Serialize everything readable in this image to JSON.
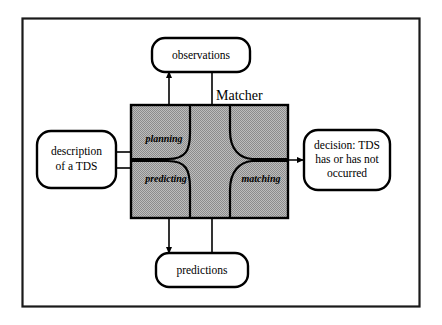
{
  "figure": {
    "type": "block-diagram",
    "border": {
      "color": "#1a1a1a"
    },
    "matcher": {
      "label": "Matcher",
      "fill_color": "#a9a9a9",
      "border_color": "#000000"
    },
    "regions": [
      {
        "id": "planning",
        "label": "planning"
      },
      {
        "id": "predicting",
        "label": "predicting"
      },
      {
        "id": "matching",
        "label": "matching"
      }
    ],
    "nodes": [
      {
        "id": "observations",
        "label": "observations",
        "lines": [
          "observations"
        ]
      },
      {
        "id": "description",
        "label": "description of a TDS",
        "lines": [
          "description",
          "of a TDS"
        ]
      },
      {
        "id": "predictions",
        "label": "predictions",
        "lines": [
          "predictions"
        ]
      },
      {
        "id": "decision",
        "label": "decision: TDS has or has not occurred",
        "lines": [
          "decision: TDS",
          "has or has not",
          "occurred"
        ]
      }
    ],
    "connections": [
      {
        "id": "planning-to-observations",
        "from": "planning",
        "to": "observations",
        "arrow": true
      },
      {
        "id": "observations-to-matching",
        "from": "observations",
        "to": "matching",
        "arrow": false
      },
      {
        "id": "description-to-planning",
        "from": "description",
        "to": "planning",
        "arrow": false
      },
      {
        "id": "description-to-predicting",
        "from": "description",
        "to": "predicting",
        "arrow": false
      },
      {
        "id": "predicting-to-predictions",
        "from": "predicting",
        "to": "predictions",
        "arrow": true
      },
      {
        "id": "predictions-to-matching",
        "from": "predictions",
        "to": "matching",
        "arrow": false
      },
      {
        "id": "matching-to-decision",
        "from": "matching",
        "to": "decision",
        "arrow": true
      }
    ]
  }
}
